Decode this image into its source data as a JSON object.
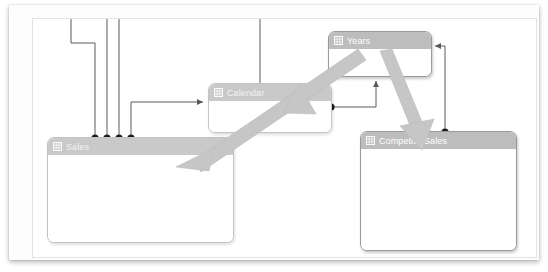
{
  "diagram": {
    "kind": "data-model-relationship-diagram",
    "canvas_background": "#ffffff",
    "frame_background": "#fdfdfd",
    "tables": [
      {
        "id": "sales",
        "name": "Sales",
        "icon": "table-icon",
        "header_color": "#bdbdbd",
        "body_color": "#ffffff",
        "state": "faded",
        "columns_visible": false
      },
      {
        "id": "calendar",
        "name": "Calendar",
        "icon": "table-icon",
        "header_color": "#c9c9c9",
        "body_color": "#ffffff",
        "state": "faded",
        "columns_visible": false
      },
      {
        "id": "years",
        "name": "Years",
        "icon": "table-icon",
        "header_color": "#bdbdbd",
        "body_color": "#ffffff",
        "state": "normal",
        "columns_visible": false
      },
      {
        "id": "competitorsales",
        "name": "CompetitorSales",
        "icon": "table-icon",
        "header_color": "#bdbdbd",
        "body_color": "#ffffff",
        "state": "normal",
        "columns_visible": false
      }
    ],
    "relationships": [
      {
        "id": "rel-sales-calendar",
        "from": "Sales",
        "to": "Calendar",
        "style": "thin",
        "from_marker": "many-dot",
        "to_marker": "one-arrow"
      },
      {
        "id": "rel-sales-offscreen-1",
        "from": "Sales",
        "to": "",
        "style": "thin",
        "from_marker": "many-dot",
        "to_marker": "none"
      },
      {
        "id": "rel-sales-offscreen-2",
        "from": "Sales",
        "to": "",
        "style": "thin",
        "from_marker": "many-dot",
        "to_marker": "none"
      },
      {
        "id": "rel-sales-offscreen-3",
        "from": "Sales",
        "to": "",
        "style": "thin",
        "from_marker": "many-dot",
        "to_marker": "none"
      },
      {
        "id": "rel-calendar-years",
        "from": "Calendar",
        "to": "Years",
        "style": "thin",
        "from_marker": "many-dot",
        "to_marker": "one-arrow"
      },
      {
        "id": "rel-calendar-offscreen",
        "from": "Calendar",
        "to": "",
        "style": "thin",
        "from_marker": "many-dot",
        "to_marker": "none"
      },
      {
        "id": "rel-competitor-years",
        "from": "CompetitorSales",
        "to": "Years",
        "style": "thin",
        "from_marker": "many-dot",
        "to_marker": "one-arrow"
      }
    ],
    "filter_flows": [
      {
        "id": "flow-years-calendar-sales",
        "from": "Years",
        "to": "Sales",
        "via": "Calendar",
        "style": "thick-arrow",
        "color": "#c6c6c6"
      },
      {
        "id": "flow-years-competitor",
        "from": "Years",
        "to": "CompetitorSales",
        "via": "",
        "style": "thick-arrow",
        "color": "#c6c6c6"
      }
    ]
  }
}
